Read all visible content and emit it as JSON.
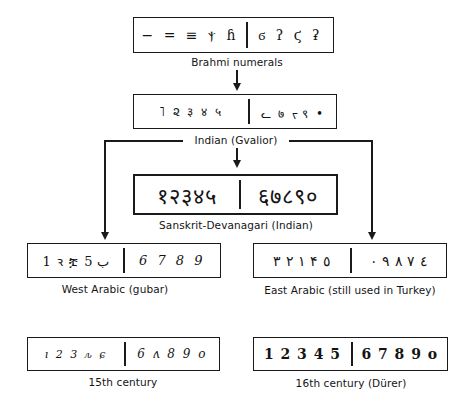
{
  "nodes": {
    "brahmi": {
      "label": "Brahmi numerals",
      "left": "− = ≡ ⲯ ɦ",
      "right": "ϭ ʔ ϛ ʡ"
    },
    "indian_gvalior": {
      "label": "Indian (Gvalior)",
      "left": "˥ ૨ ३ ४ ५",
      "right": "ᓚ ७ ᡕ ९ •"
    },
    "sanskrit_devanagari": {
      "label": "Sanskrit-Devanagari (Indian)",
      "left": "१२३४५",
      "right": "६७८९०"
    },
    "west_arabic": {
      "label": "West Arabic (gubar)",
      "left": "1 ꝛ ቿ ب 5",
      "right": "6 7 8 9"
    },
    "east_arabic": {
      "label": "East Arabic (still used in Turkey)",
      "left": "١ ٢ ٣ ۴ ٥",
      "right": "٤ ٧ ٨ ٩ ٠"
    },
    "fifteenth_century": {
      "label": "15th century",
      "left": "ı 2 3 ԉ ɕ",
      "right": "6 ʌ 8 9 o"
    },
    "sixteenth_century": {
      "label": "16th century (Dürer)",
      "left": "1 2 3 4 5",
      "right": "6 7 8 9 o"
    }
  },
  "edges": [
    {
      "from": "Brahmi numerals",
      "to": "Indian (Gvalior)"
    },
    {
      "from": "Indian (Gvalior)",
      "to": "Sanskrit-Devanagari (Indian)"
    },
    {
      "from": "Indian (Gvalior)",
      "to": "West Arabic (gubar)"
    },
    {
      "from": "Indian (Gvalior)",
      "to": "East Arabic (still used in Turkey)"
    }
  ],
  "colors": {
    "ink": "#1a1a1a",
    "background": "#ffffff"
  }
}
